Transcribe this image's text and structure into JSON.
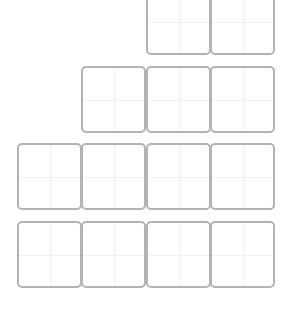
{
  "board": {
    "cell_width": 65,
    "cell_height": 67,
    "border_color": "#b3b3b3",
    "guide_color": "#f0f0f0",
    "rows": [
      {
        "top": -12,
        "cells": [
          {
            "left": 146
          },
          {
            "left": 210
          }
        ]
      },
      {
        "top": 66,
        "cells": [
          {
            "left": 81
          },
          {
            "left": 146
          },
          {
            "left": 210
          }
        ]
      },
      {
        "top": 143,
        "cells": [
          {
            "left": 17
          },
          {
            "left": 81
          },
          {
            "left": 146
          },
          {
            "left": 210
          }
        ]
      },
      {
        "top": 221,
        "cells": [
          {
            "left": 17
          },
          {
            "left": 81
          },
          {
            "left": 146
          },
          {
            "left": 210
          }
        ]
      }
    ]
  }
}
